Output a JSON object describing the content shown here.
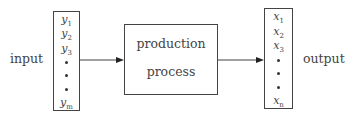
{
  "diagram": {
    "input_label": "input",
    "output_label": "output",
    "process": {
      "line1": "production",
      "line2": "process"
    },
    "input_vector": {
      "items": [
        {
          "base": "y",
          "sub": "1"
        },
        {
          "base": "y",
          "sub": "2"
        },
        {
          "base": "y",
          "sub": "3"
        },
        {
          "base": "y",
          "sub": "m"
        }
      ]
    },
    "output_vector": {
      "items": [
        {
          "base": "x",
          "sub": "1"
        },
        {
          "base": "x",
          "sub": "2"
        },
        {
          "base": "x",
          "sub": "3"
        },
        {
          "base": "x",
          "sub": "n"
        }
      ]
    },
    "edges": [
      {
        "from": "input_vector",
        "to": "process"
      },
      {
        "from": "process",
        "to": "output_vector"
      }
    ]
  }
}
